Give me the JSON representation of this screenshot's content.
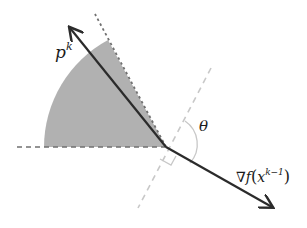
{
  "diagram": {
    "labels": {
      "p": "p",
      "p_sup": "k",
      "theta": "θ",
      "grad_nabla": "∇",
      "grad_f": "f",
      "grad_open": "(",
      "grad_x": "x",
      "grad_sup": "k−1",
      "grad_close": ")"
    },
    "colors": {
      "arrow": "#2b2b2b",
      "shade": "#a9a9a9",
      "dashed_dark": "#707070",
      "dashed_light": "#c8c8c8"
    },
    "geometry": {
      "origin": [
        166,
        147
      ],
      "p_tip": [
        69,
        27
      ],
      "grad_tip": [
        273,
        207
      ],
      "sector_radius": 122
    }
  }
}
